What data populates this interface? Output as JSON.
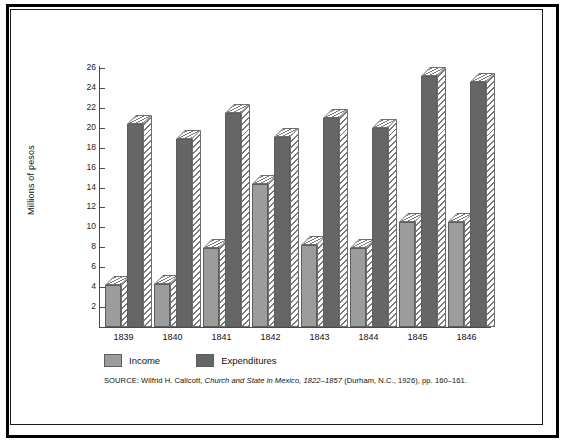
{
  "figure": {
    "ylabel": "Millions of pesos",
    "source_prefix": "SOURCE:",
    "source_author": " Wilfrid H. Callcott, ",
    "source_title": "Church and State in Mexico, 1822–1857",
    "source_rest": " (Durham, N.C., 1926), pp. 160–161."
  },
  "legend": {
    "items": [
      {
        "label": "Income",
        "color": "#9c9c9c",
        "key": "income"
      },
      {
        "label": "Expenditures",
        "color": "#666666",
        "key": "expenditures"
      }
    ]
  },
  "chart_data": {
    "type": "bar",
    "title": "",
    "xlabel": "",
    "ylabel": "Millions of pesos",
    "categories": [
      "1839",
      "1840",
      "1841",
      "1842",
      "1843",
      "1844",
      "1845",
      "1846"
    ],
    "series": [
      {
        "name": "Income",
        "color": "#9c9c9c",
        "values": [
          4.2,
          4.3,
          7.9,
          14.4,
          8.2,
          7.9,
          10.5,
          10.5
        ]
      },
      {
        "name": "Expenditures",
        "color": "#666666",
        "values": [
          20.4,
          18.9,
          21.5,
          19.1,
          21.0,
          20.0,
          25.2,
          24.6
        ]
      }
    ],
    "ylim": [
      0,
      26
    ],
    "yticks": [
      2,
      4,
      6,
      8,
      10,
      12,
      14,
      16,
      18,
      20,
      22,
      24,
      26
    ],
    "ytick_labels": [
      "2",
      "4",
      "6",
      "8",
      "10",
      "12",
      "14",
      "16",
      "18",
      "20",
      "22",
      "24",
      "26"
    ],
    "grid": false,
    "legend_position": "bottom-left",
    "style": "3d-hatched-bars"
  }
}
